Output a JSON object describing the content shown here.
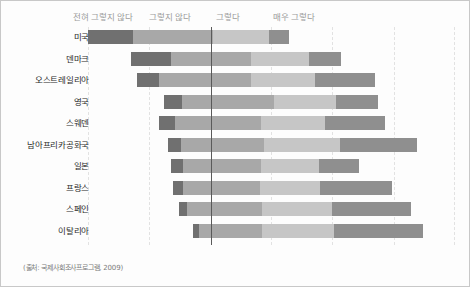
{
  "legend": {
    "items": [
      {
        "label": "전혀 그렇지 않다",
        "color": "#707070",
        "left": 72
      },
      {
        "label": "그렇지 않다",
        "color": "#a8a8a8",
        "left": 148
      },
      {
        "label": "그렇다",
        "color": "#c6c6c6",
        "left": 215
      },
      {
        "label": "매우 그렇다",
        "color": "#8f8f8f",
        "left": 272
      }
    ]
  },
  "source": {
    "text": "(출처: 국제사회조사프로그램, 2009)"
  },
  "chart_data": {
    "type": "bar",
    "subtype": "diverging-stacked-bar",
    "title": "",
    "xlabel": "",
    "ylabel": "",
    "grid": true,
    "legend_position": "top",
    "categories_legend": [
      "전혀 그렇지 않다",
      "그렇지 않다",
      "그렇다",
      "매우 그렇다"
    ],
    "colors": [
      "#707070",
      "#a8a8a8",
      "#c6c6c6",
      "#8f8f8f"
    ],
    "zero_x_px": 210,
    "gridlines_px": [
      87,
      148,
      210,
      270,
      331,
      393,
      453
    ],
    "categories": [
      "미국",
      "덴마크",
      "오스트레일리아",
      "영국",
      "스웨덴",
      "남아프리카공화국",
      "일본",
      "프랑스",
      "스페인",
      "이탈리아"
    ],
    "series": [
      {
        "name": "전혀 그렇지 않다",
        "values": [
          45,
          40,
          22,
          18,
          16,
          13,
          12,
          10,
          8,
          6
        ]
      },
      {
        "name": "그렇지 않다",
        "values": [
          80,
          80,
          92,
          92,
          86,
          83,
          78,
          77,
          75,
          63
        ]
      },
      {
        "name": "그렇다",
        "values": [
          56,
          58,
          64,
          62,
          64,
          76,
          58,
          60,
          70,
          72
        ]
      },
      {
        "name": "매우 그렇다",
        "values": [
          20,
          32,
          60,
          42,
          60,
          77,
          40,
          72,
          79,
          89
        ]
      }
    ],
    "bars_px": [
      {
        "category": "미국",
        "start": 87,
        "segments": [
          45,
          80,
          56,
          20
        ]
      },
      {
        "category": "덴마크",
        "start": 130,
        "segments": [
          40,
          80,
          58,
          32
        ]
      },
      {
        "category": "오스트레일리아",
        "start": 136,
        "segments": [
          22,
          92,
          64,
          60
        ]
      },
      {
        "category": "영국",
        "start": 163,
        "segments": [
          18,
          92,
          62,
          42
        ]
      },
      {
        "category": "스웨덴",
        "start": 158,
        "segments": [
          16,
          86,
          64,
          60
        ]
      },
      {
        "category": "남아프리카공화국",
        "start": 167,
        "segments": [
          13,
          83,
          76,
          77
        ]
      },
      {
        "category": "일본",
        "start": 170,
        "segments": [
          12,
          78,
          58,
          40
        ]
      },
      {
        "category": "프랑스",
        "start": 172,
        "segments": [
          10,
          77,
          60,
          72
        ]
      },
      {
        "category": "스페인",
        "start": 178,
        "segments": [
          8,
          75,
          70,
          79
        ]
      },
      {
        "category": "이탈리아",
        "start": 192,
        "segments": [
          6,
          63,
          72,
          89
        ]
      }
    ]
  }
}
